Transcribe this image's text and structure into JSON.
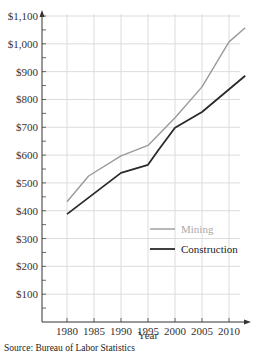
{
  "chart_data": {
    "type": "line",
    "title": "",
    "xlabel": "Year",
    "ylabel": "",
    "x_ticks": [
      "1980",
      "1985",
      "1990",
      "1995",
      "2000",
      "2005",
      "2010"
    ],
    "y_ticks": [
      "$100",
      "$200",
      "$300",
      "$400",
      "$500",
      "$600",
      "$700",
      "$800",
      "$900",
      "$1,000",
      "$1,100"
    ],
    "y_tick_values": [
      100,
      200,
      300,
      400,
      500,
      600,
      700,
      800,
      900,
      1000,
      1100
    ],
    "x_tick_values": [
      1980,
      1985,
      1990,
      1995,
      2000,
      2005,
      2010
    ],
    "xlim": [
      1977,
      2014
    ],
    "ylim": [
      0,
      1100
    ],
    "grid": true,
    "legend_placement": "center-right",
    "series": [
      {
        "name": "Mining",
        "color": "#9a9a9a",
        "x": [
          1980,
          1984,
          1990,
          1995,
          2000,
          2005,
          2010,
          2013
        ],
        "y": [
          432,
          525,
          597,
          635,
          734,
          845,
          1007,
          1058
        ]
      },
      {
        "name": "Construction",
        "color": "#2a2a2a",
        "x": [
          1980,
          1990,
          1995,
          1997,
          2000,
          2005,
          2013
        ],
        "y": [
          388,
          536,
          565,
          620,
          698,
          755,
          885
        ]
      }
    ]
  },
  "source": "Source: Bureau of Labor Statistics"
}
